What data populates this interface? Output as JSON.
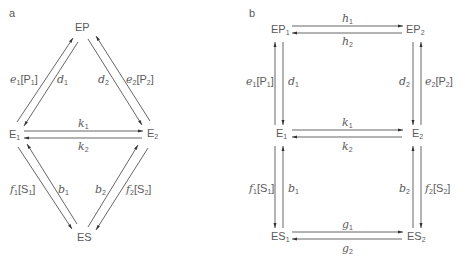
{
  "panels": [
    {
      "id": "a",
      "label": "a",
      "layout": "triangle",
      "nodes": {
        "EP": {
          "base": "EP",
          "sub": ""
        },
        "E1": {
          "base": "E",
          "sub": "1"
        },
        "E2": {
          "base": "E",
          "sub": "2"
        },
        "ES": {
          "base": "ES",
          "sub": ""
        }
      },
      "rates": {
        "e1": {
          "sym": "e",
          "sub": "1",
          "conc": "[P",
          "csub": "1",
          "close": "]"
        },
        "d1": {
          "sym": "d",
          "sub": "1"
        },
        "d2": {
          "sym": "d",
          "sub": "2"
        },
        "e2": {
          "sym": "e",
          "sub": "2",
          "conc": "[P",
          "csub": "2",
          "close": "]"
        },
        "k1": {
          "sym": "k",
          "sub": "1"
        },
        "k2": {
          "sym": "k",
          "sub": "2"
        },
        "f1": {
          "sym": "f",
          "sub": "1",
          "conc": "[S",
          "csub": "1",
          "close": "]"
        },
        "b1": {
          "sym": "b",
          "sub": "1"
        },
        "b2": {
          "sym": "b",
          "sub": "2"
        },
        "f2": {
          "sym": "f",
          "sub": "2",
          "conc": "[S",
          "csub": "2",
          "close": "]"
        }
      }
    },
    {
      "id": "b",
      "label": "b",
      "layout": "square",
      "nodes": {
        "EP1": {
          "base": "EP",
          "sub": "1"
        },
        "EP2": {
          "base": "EP",
          "sub": "2"
        },
        "E1": {
          "base": "E",
          "sub": "1"
        },
        "E2": {
          "base": "E",
          "sub": "2"
        },
        "ES1": {
          "base": "ES",
          "sub": "1"
        },
        "ES2": {
          "base": "ES",
          "sub": "2"
        }
      },
      "rates": {
        "h1": {
          "sym": "h",
          "sub": "1"
        },
        "h2": {
          "sym": "h",
          "sub": "2"
        },
        "e1": {
          "sym": "e",
          "sub": "1",
          "conc": "[P",
          "csub": "1",
          "close": "]"
        },
        "d1": {
          "sym": "d",
          "sub": "1"
        },
        "d2": {
          "sym": "d",
          "sub": "2"
        },
        "e2": {
          "sym": "e",
          "sub": "2",
          "conc": "[P",
          "csub": "2",
          "close": "]"
        },
        "k1": {
          "sym": "k",
          "sub": "1"
        },
        "k2": {
          "sym": "k",
          "sub": "2"
        },
        "f1": {
          "sym": "f",
          "sub": "1",
          "conc": "[S",
          "csub": "1",
          "close": "]"
        },
        "b1": {
          "sym": "b",
          "sub": "1"
        },
        "b2": {
          "sym": "b",
          "sub": "2"
        },
        "f2": {
          "sym": "f",
          "sub": "2",
          "conc": "[S",
          "csub": "2",
          "close": "]"
        },
        "g1": {
          "sym": "g",
          "sub": "1"
        },
        "g2": {
          "sym": "g",
          "sub": "2"
        }
      }
    }
  ],
  "colors": {
    "line": "#444444",
    "text": "#5a5a5a",
    "background": "#ffffff"
  }
}
